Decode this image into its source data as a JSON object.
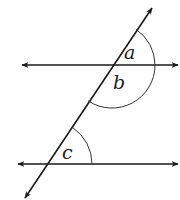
{
  "diagram": {
    "colors": {
      "line": "#1a1a1a",
      "arc": "#333333",
      "label": "#222222",
      "background": "#ffffff"
    },
    "upper_line": {
      "y": 65,
      "x1": 22,
      "x2": 178
    },
    "lower_line": {
      "y": 164,
      "x1": 18,
      "x2": 178
    },
    "transversal": {
      "top": [
        152,
        8
      ],
      "bottom": [
        25,
        198
      ]
    },
    "angles": [
      {
        "id": "a",
        "label": "a",
        "vertex": "upper intersection",
        "position": "above upper line, right of transversal"
      },
      {
        "id": "b",
        "label": "b",
        "vertex": "upper intersection",
        "position": "below upper line, right of transversal"
      },
      {
        "id": "c",
        "label": "c",
        "vertex": "lower intersection",
        "position": "above lower line, right of transversal"
      }
    ]
  }
}
